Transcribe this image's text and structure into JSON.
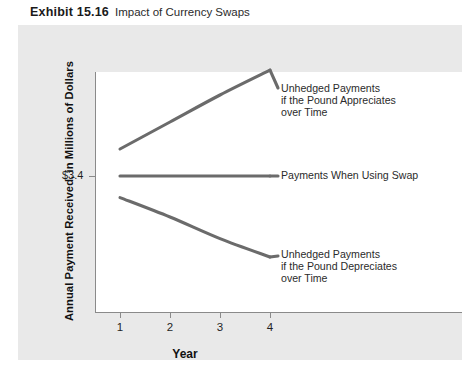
{
  "header": {
    "exhibit_number": "Exhibit 15.16",
    "exhibit_title": "Impact of Currency Swaps"
  },
  "chart_data": {
    "type": "line",
    "title": "Impact of Currency Swaps",
    "xlabel": "Year",
    "ylabel": "Annual Payment Received, in Millions of Dollars",
    "x": [
      1,
      2,
      3,
      4
    ],
    "xtick_labels": [
      "1",
      "2",
      "3",
      "4"
    ],
    "ytick_labels": [
      "$3.4"
    ],
    "yticks": [
      3.4
    ],
    "ylim": [
      2.4,
      4.6
    ],
    "xlim": [
      0.5,
      4.6
    ],
    "grid": false,
    "legend_position": "right-inline-annotations",
    "line_color": "#6b6b6b",
    "series": [
      {
        "name": "Unhedged Payments if the Pound Appreciates over Time",
        "values": [
          3.65,
          3.9,
          4.15,
          4.38
        ],
        "annotation": "Unhedged Payments\nif the Pound Appreciates\nover Time"
      },
      {
        "name": "Payments When Using Swap",
        "values": [
          3.4,
          3.4,
          3.4,
          3.4
        ],
        "annotation": "Payments When Using Swap"
      },
      {
        "name": "Unhedged Payments if the Pound Depreciates over Time",
        "values": [
          3.2,
          3.02,
          2.82,
          2.65
        ],
        "annotation": "Unhedged Payments\nif the Pound Depreciates\nover Time"
      }
    ]
  },
  "annotations": {
    "top": "Unhedged Payments\nif the Pound Appreciates\nover Time",
    "middle": "Payments When Using Swap",
    "bottom": "Unhedged Payments\nif the Pound Depreciates\nover Time"
  },
  "axis": {
    "x_ticks": [
      "1",
      "2",
      "3",
      "4"
    ],
    "y_tick_label": "$3.4",
    "x_title": "Year",
    "y_title": "Annual Payment Received, in Millions of Dollars"
  },
  "colors": {
    "page_background": "#ffffff",
    "card_background": "#e9e9e9",
    "panel_background": "#ffffff",
    "line": "#6b6b6b",
    "axis": "#8a8a8a",
    "text": "#1f1f1f"
  }
}
